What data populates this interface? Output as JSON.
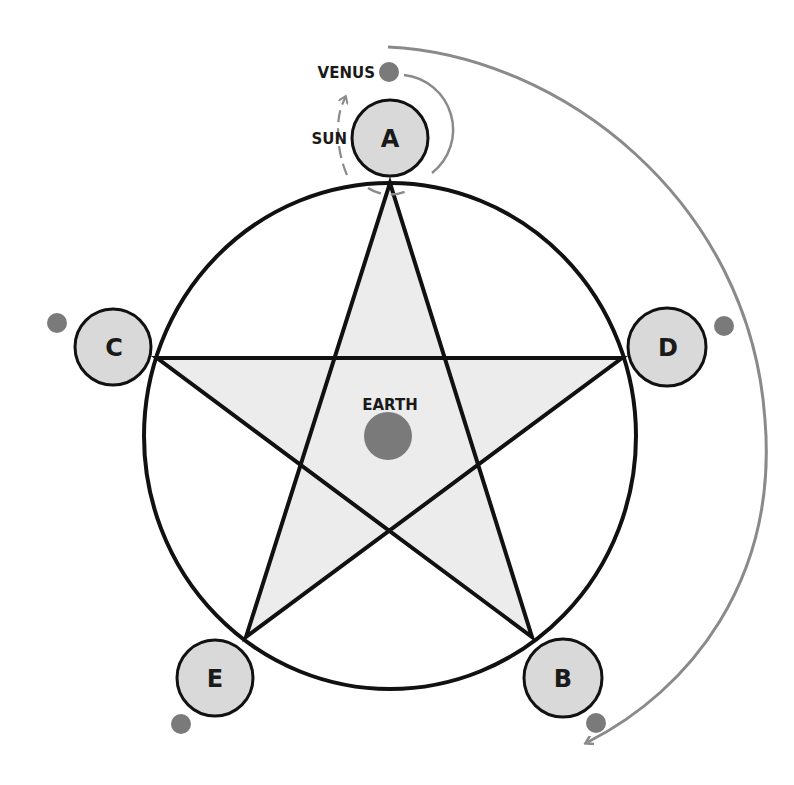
{
  "diagram": {
    "center_label": "EARTH",
    "sun_label": "SUN",
    "venus_label": "VENUS",
    "nodes": [
      {
        "id": "A",
        "label": "A"
      },
      {
        "id": "B",
        "label": "B"
      },
      {
        "id": "C",
        "label": "C"
      },
      {
        "id": "D",
        "label": "D"
      },
      {
        "id": "E",
        "label": "E"
      }
    ],
    "colors": {
      "node_fill": "#d9d9d9",
      "star_fill": "#ececec",
      "outline": "#111111",
      "planet": "#7a7a7a",
      "orbit_arrow": "#8a8a8a"
    }
  }
}
